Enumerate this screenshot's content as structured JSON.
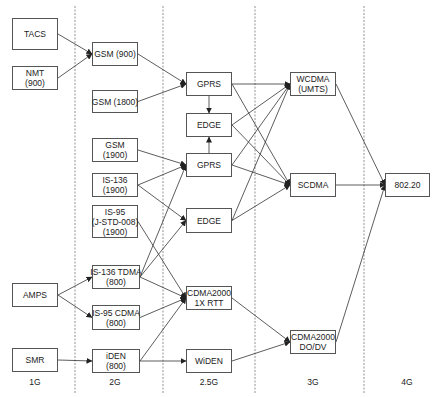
{
  "diagram": {
    "title": "",
    "generations": [
      {
        "id": "1g",
        "label": "1G",
        "x": 35
      },
      {
        "id": "2g",
        "label": "2G",
        "x": 115
      },
      {
        "id": "2_5g",
        "label": "2.5G",
        "x": 209
      },
      {
        "id": "3g",
        "label": "3G",
        "x": 313
      },
      {
        "id": "4g",
        "label": "4G",
        "x": 407
      }
    ],
    "dividers": [
      75,
      163,
      255,
      364
    ],
    "nodes": [
      {
        "id": "tacs",
        "lines": [
          "TACS"
        ],
        "x": 12,
        "y": 18,
        "w": 46,
        "h": 32
      },
      {
        "id": "nmt",
        "lines": [
          "NMT",
          "(900)"
        ],
        "x": 12,
        "y": 66,
        "w": 46,
        "h": 24
      },
      {
        "id": "amps",
        "lines": [
          "AMPS"
        ],
        "x": 12,
        "y": 283,
        "w": 46,
        "h": 24
      },
      {
        "id": "smr",
        "lines": [
          "SMR"
        ],
        "x": 12,
        "y": 348,
        "w": 46,
        "h": 24
      },
      {
        "id": "gsm900",
        "lines": [
          "GSM (900)"
        ],
        "x": 92,
        "y": 42,
        "w": 46,
        "h": 24
      },
      {
        "id": "gsm1800",
        "lines": [
          "GSM (1800)"
        ],
        "x": 92,
        "y": 90,
        "w": 46,
        "h": 23
      },
      {
        "id": "gsm1900",
        "lines": [
          "GSM",
          "(1900)"
        ],
        "x": 92,
        "y": 138,
        "w": 46,
        "h": 24
      },
      {
        "id": "is136_1900",
        "lines": [
          "IS-136",
          "(1900)"
        ],
        "x": 92,
        "y": 173,
        "w": 46,
        "h": 24
      },
      {
        "id": "is95_1900",
        "lines": [
          "IS-95",
          "(J-STD-008)",
          "(1900)"
        ],
        "x": 92,
        "y": 205,
        "w": 46,
        "h": 33
      },
      {
        "id": "is136tdma",
        "lines": [
          "IS-136 TDMA",
          "(800)"
        ],
        "x": 92,
        "y": 265,
        "w": 48,
        "h": 24
      },
      {
        "id": "is95cdma",
        "lines": [
          "IS-95 CDMA",
          "(800)"
        ],
        "x": 92,
        "y": 305,
        "w": 48,
        "h": 25
      },
      {
        "id": "iden",
        "lines": [
          "iDEN",
          "(800)"
        ],
        "x": 92,
        "y": 349,
        "w": 48,
        "h": 24
      },
      {
        "id": "gprs1",
        "lines": [
          "GPRS"
        ],
        "x": 186,
        "y": 72,
        "w": 46,
        "h": 24
      },
      {
        "id": "edge1",
        "lines": [
          "EDGE"
        ],
        "x": 186,
        "y": 113,
        "w": 46,
        "h": 24
      },
      {
        "id": "gprs2",
        "lines": [
          "GPRS"
        ],
        "x": 186,
        "y": 153,
        "w": 46,
        "h": 24
      },
      {
        "id": "edge2",
        "lines": [
          "EDGE"
        ],
        "x": 186,
        "y": 208,
        "w": 46,
        "h": 25
      },
      {
        "id": "cdma1x",
        "lines": [
          "CDMA2000",
          "1X RTT"
        ],
        "x": 186,
        "y": 286,
        "w": 46,
        "h": 24
      },
      {
        "id": "widen",
        "lines": [
          "WiDEN"
        ],
        "x": 186,
        "y": 349,
        "w": 46,
        "h": 24
      },
      {
        "id": "wcdma",
        "lines": [
          "WCDMA",
          "(UMTS)"
        ],
        "x": 290,
        "y": 72,
        "w": 46,
        "h": 24
      },
      {
        "id": "scdma",
        "lines": [
          "SCDMA"
        ],
        "x": 290,
        "y": 173,
        "w": 46,
        "h": 24
      },
      {
        "id": "cdmadodv",
        "lines": [
          "CDMA2000",
          "DO/DV"
        ],
        "x": 290,
        "y": 330,
        "w": 46,
        "h": 24
      },
      {
        "id": "n80220",
        "lines": [
          "802.20"
        ],
        "x": 385,
        "y": 173,
        "w": 45,
        "h": 24
      }
    ],
    "edges": [
      [
        "tacs",
        "gsm900"
      ],
      [
        "nmt",
        "gsm900"
      ],
      [
        "gsm900",
        "gprs1"
      ],
      [
        "gsm1800",
        "gprs1"
      ],
      [
        "gprs1",
        "edge1"
      ],
      [
        "gprs2",
        "edge1"
      ],
      [
        "gsm1900",
        "gprs2"
      ],
      [
        "is136_1900",
        "gprs2"
      ],
      [
        "is136_1900",
        "edge2"
      ],
      [
        "is136tdma",
        "gprs2"
      ],
      [
        "is136tdma",
        "edge2"
      ],
      [
        "is136tdma",
        "cdma1x"
      ],
      [
        "is95_1900",
        "cdma1x"
      ],
      [
        "is95cdma",
        "cdma1x"
      ],
      [
        "iden",
        "cdma1x"
      ],
      [
        "amps",
        "is136tdma"
      ],
      [
        "amps",
        "is95cdma"
      ],
      [
        "smr",
        "iden"
      ],
      [
        "iden",
        "widen"
      ],
      [
        "gprs1",
        "wcdma"
      ],
      [
        "gprs1",
        "scdma"
      ],
      [
        "edge1",
        "wcdma"
      ],
      [
        "edge1",
        "scdma"
      ],
      [
        "gprs2",
        "wcdma"
      ],
      [
        "gprs2",
        "scdma"
      ],
      [
        "edge2",
        "wcdma"
      ],
      [
        "edge2",
        "scdma"
      ],
      [
        "cdma1x",
        "cdmadodv"
      ],
      [
        "widen",
        "cdmadodv"
      ],
      [
        "wcdma",
        "n80220"
      ],
      [
        "scdma",
        "n80220"
      ],
      [
        "cdmadodv",
        "n80220"
      ]
    ],
    "colors": {
      "line": "#333333",
      "divider": "#777777",
      "box_border": "#555555"
    }
  }
}
